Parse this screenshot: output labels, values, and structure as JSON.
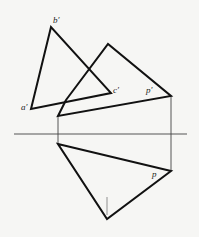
{
  "diagram": {
    "type": "descriptive-geometry projection",
    "labels": {
      "b_prime": "b′",
      "a_prime": "a′",
      "c_prime": "c′",
      "p_prime": "p′",
      "p": "p"
    },
    "colors": {
      "line": "#111111",
      "ground_line": "#555555",
      "projection_line": "#444444",
      "background": "#f6f6f4"
    },
    "triangle_abc_front": {
      "b": [
        51,
        27
      ],
      "a": [
        31,
        109
      ],
      "c": [
        111,
        93
      ]
    },
    "plane_front": {
      "apex": [
        108,
        44
      ],
      "p": [
        171,
        96
      ],
      "bottom_left": [
        58,
        116
      ],
      "notch": [
        66,
        100
      ]
    },
    "plane_top": {
      "left": [
        58,
        144
      ],
      "p": [
        171,
        171
      ],
      "bottom": [
        107,
        219
      ]
    },
    "ground_line": {
      "x1": 14,
      "x2": 187,
      "y": 134
    }
  }
}
